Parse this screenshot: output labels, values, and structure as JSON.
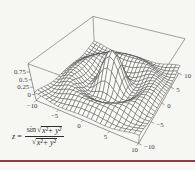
{
  "page": {
    "background": "#f6f6f3",
    "footer_rule_color": "#8e3b46"
  },
  "chart_data": {
    "type": "surface",
    "function": "sinc",
    "formula_text": "z = sin(√(x²+y²)) / √(x²+y²)",
    "x_range": [
      -10,
      10
    ],
    "y_range": [
      -10,
      10
    ],
    "z_min": -0.217,
    "z_max": 1.0,
    "mesh_divisions": 24,
    "x_ticks": [
      -10,
      -5,
      0,
      5,
      10
    ],
    "x_tick_labels": [
      "−10",
      "−5",
      "0",
      "5",
      "10"
    ],
    "y_ticks": [
      -10,
      -5,
      0,
      5,
      10
    ],
    "y_tick_labels": [
      "−10",
      "−5",
      "0",
      "5",
      "10"
    ],
    "z_ticks": [
      0,
      0.25,
      0.5,
      0.75
    ],
    "z_tick_labels": [
      "0",
      "0.25",
      "0.5",
      "0.75"
    ],
    "view_point": [
      1.3,
      -2.4,
      2
    ],
    "box_ratios": [
      1,
      1,
      0.4
    ],
    "grid": true,
    "legend": "none",
    "mesh_line_color": "#424242",
    "surface_fill": "#fbfbf8",
    "box_line_color": "#585858",
    "tick_label_color": "#3a3a3a"
  },
  "annotation": {
    "lhs_var": "z",
    "lhs_eq": "=",
    "func": "sin",
    "radical": "√",
    "radicand": "x²+ y²"
  }
}
